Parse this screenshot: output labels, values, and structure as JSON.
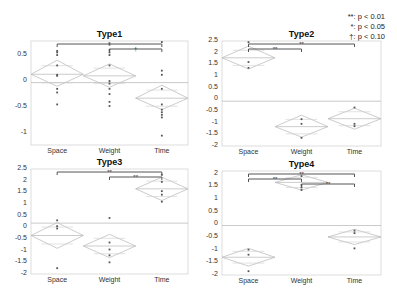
{
  "legend": {
    "items": [
      {
        "symbol": "**",
        "label": ": p < 0.01"
      },
      {
        "symbol": "*",
        "label": ": p < 0.05"
      },
      {
        "symbol": "†",
        "label": ": p < 0.10"
      }
    ]
  },
  "caption": {
    "text": "",
    "note": "caption present at bottom of figure but illegible at this resolution"
  },
  "chart_data": [
    {
      "type": "scatter",
      "title": "Type1",
      "categories": [
        "Space",
        "Weight",
        "Time"
      ],
      "yticks": [
        "0.5",
        "0",
        "-0.5",
        "-1"
      ],
      "ytick_values": [
        0.5,
        0,
        -0.5,
        -1
      ],
      "ylim": [
        -1.23,
        0.77
      ],
      "grand_mean": -0.03,
      "means": [
        0.13,
        0.1,
        -0.33
      ],
      "ci": [
        [
          -0.1,
          0.4
        ],
        [
          -0.12,
          0.33
        ],
        [
          -0.55,
          -0.08
        ]
      ],
      "points": [
        [
          0.58,
          0.55,
          0.5,
          0.3,
          0.12,
          0.1,
          -0.15,
          -0.22,
          -0.45
        ],
        [
          0.7,
          0.6,
          0.55,
          0.5,
          0.3,
          0.0,
          -0.05,
          -0.15,
          -0.25,
          -0.4,
          -0.48
        ],
        [
          0.75,
          0.2,
          0.12,
          -0.15,
          -0.45,
          -0.55,
          -0.6,
          -0.65,
          -0.7,
          -1.05
        ]
      ],
      "significance": [
        {
          "from": "Space",
          "to": "Time",
          "mark": "*"
        },
        {
          "from": "Weight",
          "to": "Time",
          "mark": "†"
        }
      ]
    },
    {
      "type": "scatter",
      "title": "Type2",
      "categories": [
        "Space",
        "Weight",
        "Time"
      ],
      "yticks": [
        "2.5",
        "2",
        "1.5",
        "1",
        "0.5",
        "0",
        "-0.5",
        "-1",
        "-1.5",
        "-2"
      ],
      "ytick_values": [
        2.5,
        2,
        1.5,
        1,
        0.5,
        0,
        -0.5,
        -1,
        -1.5,
        -2
      ],
      "ylim": [
        -2,
        2.5
      ],
      "grand_mean": -0.08,
      "means": [
        1.78,
        -1.17,
        -0.83
      ],
      "ci": [
        [
          1.3,
          2.28
        ],
        [
          -1.62,
          -0.68
        ],
        [
          -1.28,
          -0.38
        ]
      ],
      "points": [
        [
          2.45,
          1.6,
          1.35
        ],
        [
          -0.85,
          -1.05,
          -1.65
        ],
        [
          -0.35,
          -1.05,
          -1.15
        ]
      ],
      "significance": [
        {
          "from": "Space",
          "to": "Time",
          "mark": "**"
        },
        {
          "from": "Space",
          "to": "Weight",
          "mark": "**"
        }
      ]
    },
    {
      "type": "scatter",
      "title": "Type3",
      "categories": [
        "Space",
        "Weight",
        "Time"
      ],
      "yticks": [
        "2.5",
        "2",
        "1.5",
        "1",
        "0.5",
        "0",
        "-0.5",
        "-1",
        "-1.5",
        "-2"
      ],
      "ytick_values": [
        2.5,
        2,
        1.5,
        1,
        0.5,
        0,
        -0.5,
        -1,
        -1.5,
        -2
      ],
      "ylim": [
        -2,
        2.5
      ],
      "grand_mean": 0.18,
      "means": [
        -0.35,
        -0.8,
        1.65
      ],
      "ci": [
        [
          -0.9,
          0.2
        ],
        [
          -1.3,
          -0.3
        ],
        [
          1.15,
          2.15
        ]
      ],
      "points": [
        [
          0.3,
          0.05,
          -0.05,
          -1.75
        ],
        [
          0.4,
          -0.65,
          -0.95,
          -1.2,
          -1.5
        ],
        [
          2.25,
          1.95,
          1.55,
          1.4,
          1.1
        ]
      ],
      "significance": [
        {
          "from": "Space",
          "to": "Time",
          "mark": "**"
        },
        {
          "from": "Weight",
          "to": "Time",
          "mark": "**"
        }
      ]
    },
    {
      "type": "scatter",
      "title": "Type4",
      "categories": [
        "Space",
        "Weight",
        "Time"
      ],
      "yticks": [
        "2",
        "1.5",
        "1",
        "0.5",
        "0",
        "-0.5",
        "-1",
        "-1.5",
        "-2"
      ],
      "ytick_values": [
        2,
        1.5,
        1,
        0.5,
        0,
        -0.5,
        -1,
        -1.5,
        -2
      ],
      "ylim": [
        -2,
        2.1
      ],
      "grand_mean": -0.05,
      "means": [
        -1.3,
        1.65,
        -0.5
      ],
      "ci": [
        [
          -1.65,
          -0.95
        ],
        [
          1.35,
          1.95
        ],
        [
          -0.8,
          -0.2
        ]
      ],
      "points": [
        [
          -1.0,
          -1.2,
          -1.85
        ],
        [
          1.9,
          1.55,
          1.45,
          1.35
        ],
        [
          -0.25,
          -0.35,
          -0.95
        ]
      ],
      "significance": [
        {
          "from": "Space",
          "to": "Time",
          "mark": "**"
        },
        {
          "from": "Space",
          "to": "Weight",
          "mark": "**"
        },
        {
          "from": "Weight",
          "to": "Time",
          "mark": "**"
        }
      ]
    }
  ]
}
